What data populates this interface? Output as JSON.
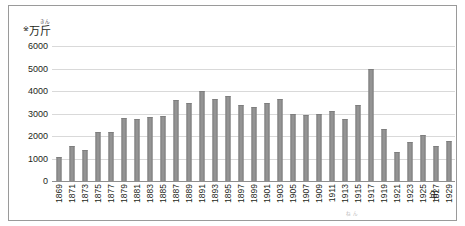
{
  "axis_unit": {
    "mark": "※",
    "man": "万",
    "kin_ruby": "きん",
    "kin": "斤",
    "x_unit": "年",
    "bottom_note": "ねん"
  },
  "chart_data": {
    "type": "bar",
    "title": "",
    "xlabel": "年",
    "ylabel": "万斤",
    "ylim": [
      0,
      6000
    ],
    "yticks": [
      6000,
      5000,
      4000,
      3000,
      2000,
      1000,
      0
    ],
    "grid": true,
    "legend": "none",
    "xtick_step": 2,
    "xtick_labels": [
      "1869",
      "1871",
      "1873",
      "1875",
      "1877",
      "1879",
      "1881",
      "1883",
      "1885",
      "1887",
      "1889",
      "1891",
      "1893",
      "1895",
      "1897",
      "1899",
      "1901",
      "1903",
      "1905",
      "1907",
      "1909",
      "1911",
      "1913",
      "1915",
      "1917",
      "1919",
      "1921",
      "1923",
      "1925",
      "1927",
      "1929"
    ],
    "categories": [
      "1869",
      "1871",
      "1873",
      "1875",
      "1877",
      "1879",
      "1881",
      "1883",
      "1885",
      "1887",
      "1889",
      "1891",
      "1893",
      "1895",
      "1897",
      "1899",
      "1901",
      "1903",
      "1905",
      "1907",
      "1909",
      "1911",
      "1913",
      "1915",
      "1917",
      "1919",
      "1921",
      "1923",
      "1925",
      "1927",
      "1929"
    ],
    "values": [
      1050,
      1550,
      1400,
      2200,
      2200,
      2800,
      2750,
      2850,
      2900,
      3600,
      3450,
      4000,
      3650,
      3800,
      3400,
      3300,
      3450,
      3650,
      3000,
      2950,
      3000,
      3100,
      2750,
      3400,
      5000,
      2300,
      1300,
      1750,
      2050,
      1550,
      1800
    ]
  }
}
